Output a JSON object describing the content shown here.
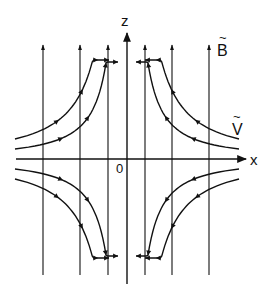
{
  "diagram": {
    "axes": {
      "z_label": "z",
      "x_label": "x",
      "origin_label": "0"
    },
    "field_label": "B",
    "field_label_accent": "~",
    "flow_label": "V",
    "flow_label_accent": "~",
    "field_lines_count": 7,
    "flow_lines_per_quadrant": 2,
    "flow_direction": "inflow along x, outflow along z",
    "colors": {
      "ink": "#111111",
      "background": "#ffffff"
    }
  }
}
